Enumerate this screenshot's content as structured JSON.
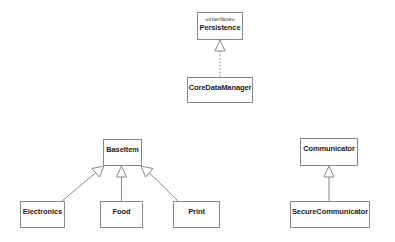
{
  "diagram": {
    "type": "UML class diagram",
    "classes": [
      {
        "id": "persistence",
        "name": "Persistence",
        "stereotype": "«interface»",
        "x": 197,
        "y": 12,
        "w": 46,
        "h": 28
      },
      {
        "id": "coredatamanager",
        "name": "CoreDataManager",
        "stereotype": "",
        "x": 187,
        "y": 77,
        "w": 66,
        "h": 26
      },
      {
        "id": "baseitem",
        "name": "BaseItem",
        "stereotype": "",
        "x": 103,
        "y": 139,
        "w": 39,
        "h": 27
      },
      {
        "id": "electronics",
        "name": "Electronics",
        "stereotype": "",
        "x": 20,
        "y": 201,
        "w": 45,
        "h": 27
      },
      {
        "id": "food",
        "name": "Food",
        "stereotype": "",
        "x": 100,
        "y": 201,
        "w": 43,
        "h": 27
      },
      {
        "id": "print",
        "name": "Print",
        "stereotype": "",
        "x": 173,
        "y": 201,
        "w": 47,
        "h": 27
      },
      {
        "id": "communicator",
        "name": "Communicator",
        "stereotype": "",
        "x": 300,
        "y": 138,
        "w": 58,
        "h": 28
      },
      {
        "id": "securecommunicator",
        "name": "SecureCommunicator",
        "stereotype": "",
        "x": 290,
        "y": 201,
        "w": 80,
        "h": 27
      }
    ],
    "relationships": [
      {
        "type": "realization",
        "from": "CoreDataManager",
        "to": "Persistence",
        "line": "dashed"
      },
      {
        "type": "generalization",
        "from": "Electronics",
        "to": "BaseItem",
        "line": "solid"
      },
      {
        "type": "generalization",
        "from": "Food",
        "to": "BaseItem",
        "line": "solid"
      },
      {
        "type": "generalization",
        "from": "Print",
        "to": "BaseItem",
        "line": "solid"
      },
      {
        "type": "generalization",
        "from": "SecureCommunicator",
        "to": "Communicator",
        "line": "solid"
      }
    ],
    "colors": {
      "border": "#8a8a8a",
      "line": "#8a8a8a",
      "text": "#222222",
      "background": "#ffffff"
    }
  }
}
